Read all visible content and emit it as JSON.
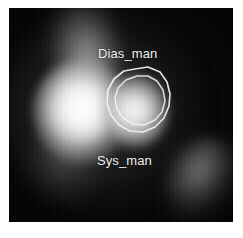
{
  "image": {
    "type": "grayscale-nuclear-medicine-scan",
    "colormap": "grayscale",
    "background_color": "#ffffff",
    "panel_color": "#050505",
    "frame": {
      "x": 9,
      "y": 8,
      "width": 224,
      "height": 214
    }
  },
  "regions_of_interest": [
    {
      "id": "dias_man",
      "label": "Dias_man",
      "label_position": {
        "x": 89,
        "y": 38
      },
      "contour": "outer",
      "contour_color": "#f2f2f2"
    },
    {
      "id": "sys_man",
      "label": "Sys_man",
      "label_position": {
        "x": 88,
        "y": 145
      },
      "contour": "inner",
      "contour_color": "#f2f2f2"
    }
  ],
  "features": [
    {
      "name": "upper-plume",
      "intensity": "medium",
      "center": {
        "x": 84,
        "y": 44
      }
    },
    {
      "name": "left-lobe",
      "intensity": "high",
      "center": {
        "x": 82,
        "y": 112
      }
    },
    {
      "name": "center-lobe",
      "intensity": "high",
      "center": {
        "x": 136,
        "y": 111
      }
    },
    {
      "name": "lower-right-lobe",
      "intensity": "low",
      "center": {
        "x": 196,
        "y": 178
      }
    }
  ]
}
